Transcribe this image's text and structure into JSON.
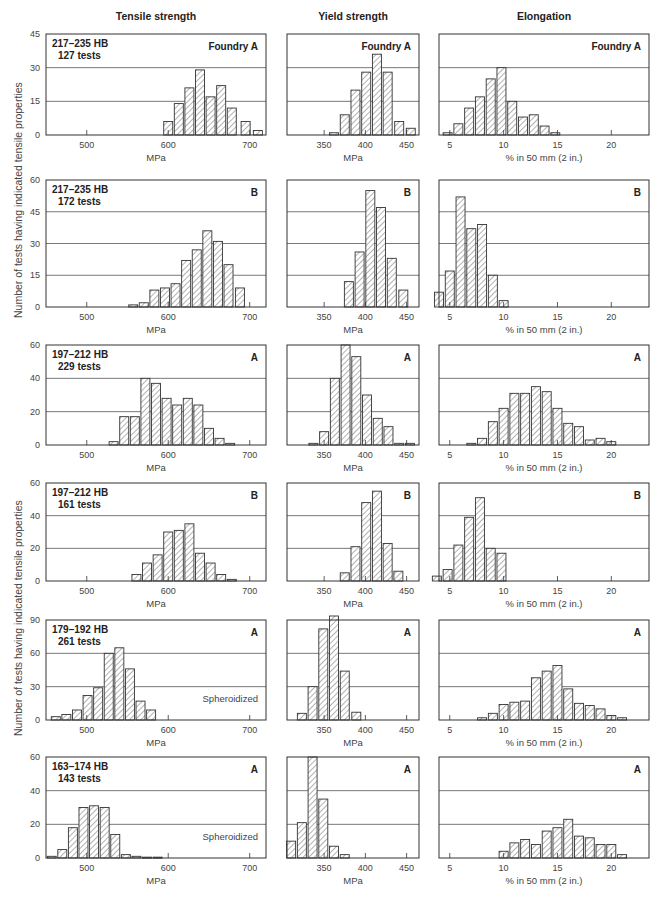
{
  "column_titles": [
    "Tensile strength",
    "Yield strength",
    "Elongation"
  ],
  "y_axis_label": "Number of tests having indicated tensile properties",
  "colors": {
    "frame": "#333333",
    "grid": "#555555",
    "bar_edge": "#333333",
    "hatch": "#555555",
    "text": "#222222",
    "tick_text": "#444444"
  },
  "chart_data": {
    "type": "bar",
    "ylabel": "Number of tests having indicated tensile properties",
    "columns": [
      {
        "name": "Tensile strength",
        "xlabel": "MPa"
      },
      {
        "name": "Yield strength",
        "xlabel": "MPa"
      },
      {
        "name": "Elongation",
        "xlabel": "% in 50 mm (2 in.)"
      }
    ],
    "rows": [
      {
        "hardness": "217–235 HB",
        "tests": "127 tests",
        "foundry": "Foundry A",
        "note": "",
        "ylim": [
          0,
          45
        ],
        "yticks": [
          0,
          15,
          30,
          45
        ],
        "panels": [
          {
            "xlim": [
              450,
              720
            ],
            "xticks": [
              500,
              600,
              700
            ],
            "bin": 13.5,
            "x": [
              600,
              613,
              626,
              639,
              652,
              665,
              678,
              695,
              710
            ],
            "values": [
              6,
              14,
              21,
              29,
              17,
              22,
              12,
              6,
              2
            ]
          },
          {
            "xlim": [
              305,
              465
            ],
            "xticks": [
              350,
              400,
              450
            ],
            "bin": 7,
            "x": [
              362,
              375,
              388,
              401,
              414,
              427,
              441,
              455
            ],
            "values": [
              1,
              9,
              20,
              28,
              36,
              28,
              6,
              3
            ]
          },
          {
            "xlim": [
              4,
              23.5
            ],
            "xticks": [
              5,
              10,
              15,
              20
            ],
            "bin": 0.65,
            "x": [
              4.8,
              5.8,
              6.8,
              7.8,
              8.8,
              9.8,
              10.8,
              11.8,
              12.8,
              13.8,
              14.8
            ],
            "values": [
              1,
              5,
              12,
              17,
              25,
              30,
              15,
              8,
              9,
              4,
              1
            ]
          }
        ]
      },
      {
        "hardness": "217–235 HB",
        "tests": "172 tests",
        "foundry": "B",
        "note": "",
        "ylim": [
          0,
          60
        ],
        "yticks": [
          0,
          15,
          30,
          45,
          60
        ],
        "panels": [
          {
            "xlim": [
              450,
              720
            ],
            "xticks": [
              500,
              600,
              700
            ],
            "bin": 8,
            "x": [
              557,
              570,
              583,
              596,
              609,
              622,
              635,
              648,
              661,
              674,
              688
            ],
            "values": [
              1,
              2,
              8,
              9,
              11,
              22,
              27,
              36,
              31,
              20,
              9
            ]
          },
          {
            "xlim": [
              305,
              465
            ],
            "xticks": [
              350,
              400,
              450
            ],
            "bin": 7,
            "x": [
              380,
              393,
              406,
              419,
              432,
              446
            ],
            "values": [
              12,
              26,
              55,
              47,
              23,
              8
            ]
          },
          {
            "xlim": [
              4,
              23.5
            ],
            "xticks": [
              5,
              10,
              15,
              20
            ],
            "bin": 0.65,
            "x": [
              4,
              5,
              6,
              7,
              8,
              9,
              10
            ],
            "values": [
              7,
              17,
              52,
              37,
              39,
              15,
              3
            ]
          }
        ]
      },
      {
        "hardness": "197–212 HB",
        "tests": "229 tests",
        "foundry": "A",
        "note": "",
        "ylim": [
          0,
          60
        ],
        "yticks": [
          0,
          20,
          40,
          60
        ],
        "panels": [
          {
            "xlim": [
              450,
              720
            ],
            "xticks": [
              500,
              600,
              700
            ],
            "bin": 8,
            "x": [
              533,
              546,
              559,
              572,
              585,
              598,
              611,
              624,
              637,
              650,
              663,
              676
            ],
            "values": [
              2,
              17,
              17,
              40,
              37,
              28,
              24,
              28,
              24,
              10,
              4,
              1
            ]
          },
          {
            "xlim": [
              305,
              465
            ],
            "xticks": [
              350,
              400,
              450
            ],
            "bin": 7,
            "x": [
              337,
              350,
              363,
              376,
              389,
              402,
              415,
              428,
              441,
              454
            ],
            "values": [
              1,
              8,
              40,
              60,
              53,
              30,
              16,
              11,
              1,
              1
            ]
          },
          {
            "xlim": [
              4,
              23.5
            ],
            "xticks": [
              5,
              10,
              15,
              20
            ],
            "bin": 0.65,
            "x": [
              7,
              8,
              9,
              10,
              11,
              12,
              13,
              14,
              15,
              16,
              17,
              18,
              19,
              20
            ],
            "values": [
              1,
              4,
              14,
              22,
              31,
              31,
              35,
              32,
              22,
              13,
              11,
              3,
              4,
              2
            ]
          }
        ]
      },
      {
        "hardness": "197–212 HB",
        "tests": "161 tests",
        "foundry": "B",
        "note": "",
        "ylim": [
          0,
          60
        ],
        "yticks": [
          0,
          20,
          40,
          60
        ],
        "panels": [
          {
            "xlim": [
              450,
              720
            ],
            "xticks": [
              500,
              600,
              700
            ],
            "bin": 8,
            "x": [
              561,
              574,
              587,
              600,
              613,
              626,
              639,
              652,
              665,
              678
            ],
            "values": [
              4,
              11,
              16,
              30,
              31,
              35,
              17,
              11,
              4,
              1
            ]
          },
          {
            "xlim": [
              305,
              465
            ],
            "xticks": [
              350,
              400,
              450
            ],
            "bin": 7,
            "x": [
              375,
              388,
              401,
              414,
              427,
              440
            ],
            "values": [
              5,
              21,
              48,
              55,
              23,
              6
            ]
          },
          {
            "xlim": [
              4,
              23.5
            ],
            "xticks": [
              5,
              10,
              15,
              20
            ],
            "bin": 0.65,
            "x": [
              3.8,
              4.8,
              5.8,
              6.8,
              7.8,
              8.8,
              9.8
            ],
            "values": [
              3,
              7,
              22,
              39,
              51,
              20,
              17
            ]
          }
        ]
      },
      {
        "hardness": "179–192 HB",
        "tests": "261 tests",
        "foundry": "A",
        "note": "Spheroidized",
        "ylim": [
          0,
          90
        ],
        "yticks": [
          0,
          30,
          60,
          90
        ],
        "panels": [
          {
            "xlim": [
              450,
              720
            ],
            "xticks": [
              500,
              600,
              700
            ],
            "bin": 8,
            "x": [
              462,
              475,
              488,
              501,
              514,
              527,
              540,
              553,
              566,
              579
            ],
            "values": [
              3,
              5,
              9,
              22,
              29,
              60,
              65,
              46,
              17,
              9
            ]
          },
          {
            "xlim": [
              305,
              465
            ],
            "xticks": [
              350,
              400,
              450
            ],
            "bin": 7,
            "x": [
              323,
              336,
              349,
              362,
              375,
              389
            ],
            "values": [
              6,
              30,
              82,
              97,
              44,
              7
            ]
          },
          {
            "xlim": [
              4,
              23.5
            ],
            "xticks": [
              5,
              10,
              15,
              20
            ],
            "bin": 0.65,
            "x": [
              8,
              9,
              10,
              11,
              12,
              13,
              14,
              15,
              16,
              17,
              18,
              19,
              20,
              21
            ],
            "values": [
              2,
              6,
              14,
              16,
              17,
              38,
              44,
              49,
              28,
              15,
              13,
              10,
              4,
              2
            ]
          }
        ]
      },
      {
        "hardness": "163–174 HB",
        "tests": "143 tests",
        "foundry": "A",
        "note": "Spheroidized",
        "ylim": [
          0,
          60
        ],
        "yticks": [
          0,
          20,
          40,
          60
        ],
        "panels": [
          {
            "xlim": [
              450,
              720
            ],
            "xticks": [
              500,
              600,
              700
            ],
            "bin": 8,
            "x": [
              457,
              470,
              483,
              496,
              509,
              522,
              535,
              548,
              561,
              574,
              587
            ],
            "values": [
              1,
              5,
              18,
              30,
              31,
              30,
              14,
              2,
              1,
              0.5,
              0.5
            ]
          },
          {
            "xlim": [
              305,
              465
            ],
            "xticks": [
              350,
              400,
              450
            ],
            "bin": 7,
            "x": [
              310,
              323,
              336,
              349,
              362,
              375
            ],
            "values": [
              10,
              21,
              60,
              35,
              7,
              2
            ]
          },
          {
            "xlim": [
              4,
              23.5
            ],
            "xticks": [
              5,
              10,
              15,
              20
            ],
            "bin": 0.65,
            "x": [
              10,
              11,
              12,
              13,
              14,
              15,
              16,
              17,
              18,
              19,
              20,
              21
            ],
            "values": [
              4,
              9,
              11,
              8,
              16,
              18,
              23,
              13,
              12,
              8,
              8,
              2
            ]
          }
        ]
      }
    ]
  }
}
